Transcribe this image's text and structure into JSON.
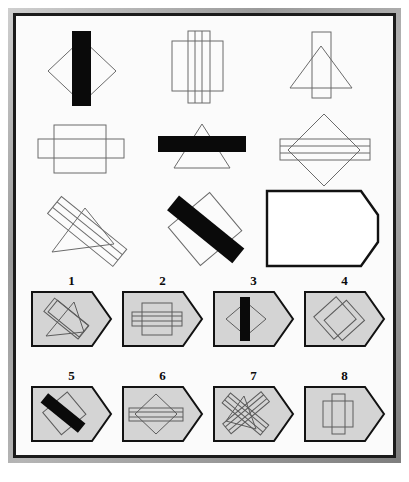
{
  "puzzle": {
    "type": "visual-analogy-matrix",
    "title": "",
    "matrix": {
      "rows": 3,
      "cols": 3,
      "cells": [
        {
          "index": 1,
          "row": 1,
          "col": 1,
          "description": "diamond with vertical black bar",
          "shapes": [
            "diamond-outline",
            "vertical-bar-black"
          ]
        },
        {
          "index": 2,
          "row": 1,
          "col": 2,
          "description": "square with tall vertical striped rectangle",
          "shapes": [
            "square-outline",
            "vertical-striped-rect"
          ]
        },
        {
          "index": 3,
          "row": 1,
          "col": 3,
          "description": "triangle with vertical rectangle",
          "shapes": [
            "triangle-outline",
            "vertical-rect-outline"
          ]
        },
        {
          "index": 4,
          "row": 2,
          "col": 1,
          "description": "square with horizontal rectangle",
          "shapes": [
            "square-outline",
            "horizontal-rect-outline"
          ]
        },
        {
          "index": 5,
          "row": 2,
          "col": 2,
          "description": "triangle with horizontal black bar",
          "shapes": [
            "triangle-outline",
            "horizontal-bar-black"
          ]
        },
        {
          "index": 6,
          "row": 2,
          "col": 3,
          "description": "diamond with horizontal striped rectangle",
          "shapes": [
            "diamond-outline",
            "horizontal-striped-rect"
          ]
        },
        {
          "index": 7,
          "row": 3,
          "col": 1,
          "description": "rotated triangle with diagonal striped rectangle",
          "shapes": [
            "triangle-rotated-outline",
            "diagonal-striped-rect"
          ]
        },
        {
          "index": 8,
          "row": 3,
          "col": 2,
          "description": "rotated square with diagonal black bar",
          "shapes": [
            "square-rotated-outline",
            "diagonal-bar-black"
          ]
        },
        {
          "index": 9,
          "row": 3,
          "col": 3,
          "description": "empty answer slot, blank tag outline",
          "shapes": [
            "answer-blank-tag"
          ]
        }
      ]
    },
    "answer_options": {
      "count": 8,
      "items": [
        {
          "number": "1",
          "description": "rotated triangle with diagonal rectangle"
        },
        {
          "number": "2",
          "description": "square with horizontal striped rectangle"
        },
        {
          "number": "3",
          "description": "diamond with vertical black bar"
        },
        {
          "number": "4",
          "description": "two overlapping rotated squares"
        },
        {
          "number": "5",
          "description": "rotated square with diagonal black bar"
        },
        {
          "number": "6",
          "description": "diamond with horizontal striped rectangle"
        },
        {
          "number": "7",
          "description": "crossed rotated rectangles over triangle"
        },
        {
          "number": "8",
          "description": "square with vertical rectangle"
        }
      ]
    },
    "colors": {
      "page_background": "#ffffff",
      "panel_background": "#fbfbfb",
      "frame_dark": "#1b1b1b",
      "frame_metal_light": "#cfcfcf",
      "frame_metal_dark": "#7e7e7e",
      "option_tag_fill": "#d4d4d4",
      "option_tag_stroke": "#121212",
      "shape_stroke": "#6b6b6b",
      "shape_solid": "#0a0a0a",
      "number_text": "#0a0a0a"
    }
  }
}
